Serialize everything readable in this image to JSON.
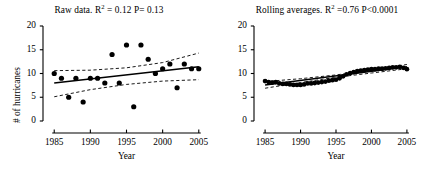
{
  "figure": {
    "width": 436,
    "height": 178,
    "background": "#ffffff",
    "ink_color": "#000000"
  },
  "chart_data": [
    {
      "type": "scatter",
      "panel": "left",
      "title_plain": "Raw data. R2 = 0.12  P= 0.13",
      "title_prefix": "Raw data. R",
      "title_sup": "2",
      "title_suffix": " = 0.12  P= 0.13",
      "r_squared": 0.12,
      "p_value": 0.13,
      "xlabel": "Year",
      "ylabel": "# of hurricanes",
      "xlim": [
        1984,
        2006
      ],
      "ylim": [
        0,
        20
      ],
      "xticks": [
        1985,
        1990,
        1995,
        2000,
        2005
      ],
      "yticks": [
        0,
        5,
        10,
        15,
        20
      ],
      "grid": false,
      "legend": "none",
      "marker": "filled-circle",
      "x": [
        1985,
        1986,
        1987,
        1988,
        1989,
        1990,
        1991,
        1992,
        1993,
        1994,
        1995,
        1996,
        1997,
        1998,
        1999,
        2000,
        2001,
        2002,
        2003,
        2004,
        2005
      ],
      "values": [
        10,
        9,
        5,
        9,
        4,
        9,
        9,
        8,
        14,
        8,
        16,
        3,
        16,
        13,
        10,
        11,
        12,
        7,
        12,
        11,
        11
      ],
      "fit_line": {
        "name": "regression",
        "style": "solid",
        "x": [
          1985,
          2005
        ],
        "y": [
          8.0,
          11.4
        ]
      },
      "confidence_bands": [
        {
          "name": "upper-confidence-limit",
          "style": "dashed",
          "x": [
            1985,
            1990,
            1995,
            2000,
            2005
          ],
          "y": [
            10.6,
            10.7,
            11.2,
            12.3,
            14.3
          ]
        },
        {
          "name": "lower-confidence-limit",
          "style": "dashed",
          "x": [
            1985,
            1990,
            1995,
            2000,
            2005
          ],
          "y": [
            5.1,
            6.6,
            7.7,
            8.4,
            8.7
          ]
        }
      ]
    },
    {
      "type": "scatter",
      "panel": "right",
      "title_plain": "Rolling averages. R2 =0.76 P<0.0001",
      "title_prefix": "Rolling averages. R",
      "title_sup": "2",
      "title_suffix": " =0.76 P<0.0001",
      "r_squared": 0.76,
      "p_value": "<0.0001",
      "xlabel": "Year",
      "ylabel": "",
      "xlim": [
        1984,
        2006
      ],
      "ylim": [
        0,
        20
      ],
      "xticks": [
        1985,
        1990,
        1995,
        2000,
        2005
      ],
      "yticks": [
        0,
        5,
        10,
        15,
        20
      ],
      "grid": false,
      "legend": "none",
      "marker": "filled-circle",
      "x": [
        1985,
        1985.5,
        1986,
        1986.5,
        1987,
        1987.5,
        1988,
        1988.5,
        1989,
        1989.5,
        1990,
        1990.5,
        1991,
        1991.5,
        1992,
        1992.5,
        1993,
        1993.5,
        1994,
        1994.5,
        1995,
        1995.5,
        1996,
        1996.5,
        1997,
        1997.5,
        1998,
        1998.5,
        1999,
        1999.5,
        2000,
        2000.5,
        2001,
        2001.5,
        2002,
        2002.5,
        2003,
        2003.5,
        2004,
        2004.5,
        2005
      ],
      "values": [
        8.4,
        8.2,
        8.1,
        8.2,
        7.9,
        7.8,
        7.8,
        7.7,
        7.6,
        7.6,
        7.6,
        7.7,
        7.9,
        7.9,
        8.0,
        8.1,
        8.2,
        8.3,
        8.5,
        8.6,
        8.7,
        9.0,
        9.4,
        9.8,
        10.1,
        10.3,
        10.5,
        10.6,
        10.7,
        10.8,
        10.9,
        10.9,
        11.0,
        11.0,
        11.1,
        11.2,
        11.3,
        11.3,
        11.4,
        11.2,
        10.9
      ],
      "fit_line": {
        "name": "regression",
        "style": "solid",
        "x": [
          1985,
          2005
        ],
        "y": [
          7.6,
          11.4
        ]
      },
      "confidence_bands": [
        {
          "name": "upper-confidence-limit",
          "style": "dashed",
          "x": [
            1985,
            1990,
            1995,
            2000,
            2005
          ],
          "y": [
            8.3,
            8.9,
            9.7,
            10.7,
            11.9
          ]
        },
        {
          "name": "lower-confidence-limit",
          "style": "dashed",
          "x": [
            1985,
            1990,
            1995,
            2000,
            2005
          ],
          "y": [
            6.9,
            8.1,
            9.2,
            10.1,
            11.0
          ]
        }
      ]
    }
  ]
}
